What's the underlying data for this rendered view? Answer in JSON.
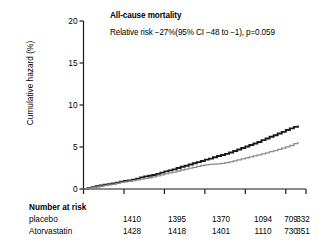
{
  "chart_data": {
    "type": "line",
    "title": "All-cause mortality",
    "annotation": "Relative risk −27%(95% CI −48 to −1), p=0.059",
    "xlabel": "",
    "ylabel": "Cumulative hazard (%)",
    "ylim": [
      0,
      20
    ],
    "yticks": [
      0,
      5,
      10,
      15,
      20
    ],
    "ytick_labels": [
      "0",
      "5",
      "10",
      "15",
      "20"
    ],
    "xlim": [
      0,
      5.5
    ],
    "xticks": [
      0,
      1,
      2,
      3,
      4,
      5,
      5.5
    ],
    "xtick_labels": [
      "",
      "",
      "",
      "",
      "",
      "",
      ""
    ],
    "grid": false,
    "legend": "none",
    "series": [
      {
        "name": "placebo",
        "color": "#1a1a1a",
        "linewidth": 1.9,
        "x": [
          0,
          0.1,
          0.2,
          0.3,
          0.4,
          0.5,
          0.6,
          0.7,
          0.8,
          0.9,
          1.0,
          1.1,
          1.2,
          1.3,
          1.4,
          1.5,
          1.6,
          1.7,
          1.8,
          1.9,
          2.0,
          2.1,
          2.2,
          2.3,
          2.4,
          2.5,
          2.6,
          2.7,
          2.8,
          2.9,
          3.0,
          3.1,
          3.2,
          3.3,
          3.4,
          3.5,
          3.6,
          3.7,
          3.8,
          3.9,
          4.0,
          4.1,
          4.2,
          4.3,
          4.4,
          4.5,
          4.6,
          4.7,
          4.8,
          4.9,
          5.0,
          5.1,
          5.2,
          5.3
        ],
        "y": [
          0.0,
          0.1,
          0.22,
          0.32,
          0.42,
          0.5,
          0.58,
          0.66,
          0.76,
          0.86,
          0.95,
          1.02,
          1.1,
          1.22,
          1.38,
          1.5,
          1.58,
          1.66,
          1.8,
          1.95,
          2.1,
          2.22,
          2.34,
          2.5,
          2.64,
          2.76,
          2.92,
          3.06,
          3.2,
          3.34,
          3.5,
          3.62,
          3.78,
          3.92,
          4.05,
          4.18,
          4.34,
          4.52,
          4.7,
          4.88,
          5.06,
          5.24,
          5.42,
          5.6,
          5.82,
          6.02,
          6.22,
          6.4,
          6.6,
          6.8,
          7.02,
          7.22,
          7.4,
          7.55
        ]
      },
      {
        "name": "Atorvastatin",
        "color": "#8c8c8c",
        "linewidth": 1.3,
        "x": [
          0,
          0.1,
          0.2,
          0.3,
          0.4,
          0.5,
          0.6,
          0.7,
          0.8,
          0.9,
          1.0,
          1.1,
          1.2,
          1.3,
          1.4,
          1.5,
          1.6,
          1.7,
          1.8,
          1.9,
          2.0,
          2.1,
          2.2,
          2.3,
          2.4,
          2.5,
          2.6,
          2.7,
          2.8,
          2.9,
          3.0,
          3.1,
          3.2,
          3.3,
          3.4,
          3.5,
          3.6,
          3.7,
          3.8,
          3.9,
          4.0,
          4.1,
          4.2,
          4.3,
          4.4,
          4.5,
          4.6,
          4.7,
          4.8,
          4.9,
          5.0,
          5.1,
          5.2,
          5.3
        ],
        "y": [
          0.0,
          0.08,
          0.18,
          0.26,
          0.34,
          0.42,
          0.5,
          0.58,
          0.68,
          0.78,
          0.86,
          0.94,
          1.0,
          1.08,
          1.18,
          1.26,
          1.34,
          1.44,
          1.56,
          1.68,
          1.8,
          1.92,
          2.02,
          2.14,
          2.26,
          2.36,
          2.48,
          2.58,
          2.7,
          2.8,
          2.88,
          2.92,
          2.96,
          3.0,
          3.06,
          3.14,
          3.24,
          3.34,
          3.46,
          3.58,
          3.7,
          3.82,
          3.94,
          4.06,
          4.18,
          4.3,
          4.44,
          4.58,
          4.72,
          4.86,
          5.02,
          5.18,
          5.4,
          5.6
        ]
      }
    ]
  },
  "risk_table": {
    "heading": "Number at risk",
    "rows": [
      {
        "label": "placebo",
        "values": [
          "1410",
          "1395",
          "1370",
          "1094",
          "709",
          "332"
        ]
      },
      {
        "label": "Atorvastatin",
        "values": [
          "1428",
          "1418",
          "1401",
          "1110",
          "730",
          "351"
        ]
      }
    ]
  }
}
